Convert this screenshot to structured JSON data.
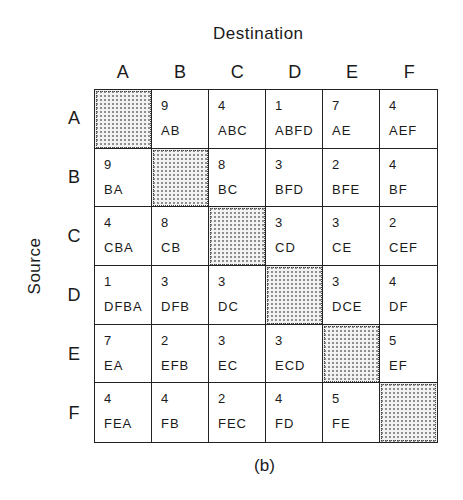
{
  "figure": {
    "title": "Destination",
    "y_axis_label": "Source",
    "caption": "(b)",
    "columns": [
      "A",
      "B",
      "C",
      "D",
      "E",
      "F"
    ],
    "rows": [
      "A",
      "B",
      "C",
      "D",
      "E",
      "F"
    ],
    "cells": [
      [
        {
          "cost": "",
          "route": "",
          "diag": true
        },
        {
          "cost": "9",
          "route": "AB"
        },
        {
          "cost": "4",
          "route": "ABC"
        },
        {
          "cost": "1",
          "route": "ABFD"
        },
        {
          "cost": "7",
          "route": "AE"
        },
        {
          "cost": "4",
          "route": "AEF"
        }
      ],
      [
        {
          "cost": "9",
          "route": "BA"
        },
        {
          "cost": "",
          "route": "",
          "diag": true
        },
        {
          "cost": "8",
          "route": "BC"
        },
        {
          "cost": "3",
          "route": "BFD"
        },
        {
          "cost": "2",
          "route": "BFE"
        },
        {
          "cost": "4",
          "route": "BF"
        }
      ],
      [
        {
          "cost": "4",
          "route": "CBA"
        },
        {
          "cost": "8",
          "route": "CB"
        },
        {
          "cost": "",
          "route": "",
          "diag": true
        },
        {
          "cost": "3",
          "route": "CD"
        },
        {
          "cost": "3",
          "route": "CE"
        },
        {
          "cost": "2",
          "route": "CEF"
        }
      ],
      [
        {
          "cost": "1",
          "route": "DFBA"
        },
        {
          "cost": "3",
          "route": "DFB"
        },
        {
          "cost": "3",
          "route": "DC"
        },
        {
          "cost": "",
          "route": "",
          "diag": true
        },
        {
          "cost": "3",
          "route": "DCE"
        },
        {
          "cost": "4",
          "route": "DF"
        }
      ],
      [
        {
          "cost": "7",
          "route": "EA"
        },
        {
          "cost": "2",
          "route": "EFB"
        },
        {
          "cost": "3",
          "route": "EC"
        },
        {
          "cost": "3",
          "route": "ECD"
        },
        {
          "cost": "",
          "route": "",
          "diag": true
        },
        {
          "cost": "5",
          "route": "EF"
        }
      ],
      [
        {
          "cost": "4",
          "route": "FEA"
        },
        {
          "cost": "4",
          "route": "FB"
        },
        {
          "cost": "2",
          "route": "FEC"
        },
        {
          "cost": "4",
          "route": "FD"
        },
        {
          "cost": "5",
          "route": "FE"
        },
        {
          "cost": "",
          "route": "",
          "diag": true
        }
      ]
    ]
  }
}
